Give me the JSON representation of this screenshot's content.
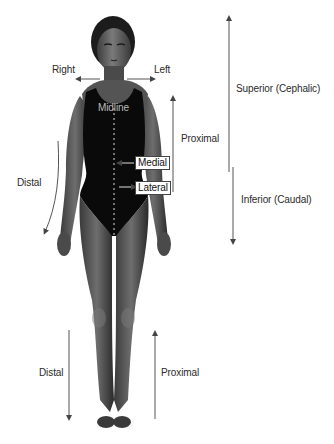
{
  "diagram": {
    "colors": {
      "background": "#ffffff",
      "skin": "#5e5e5e",
      "skin_highlight": "#8a8a8a",
      "swimsuit": "#0a0a0a",
      "arrow": "#555555",
      "text": "#2a2a2a"
    },
    "labels": {
      "right": "Right",
      "left": "Left",
      "midline": "Midline",
      "medial": "Medial",
      "lateral": "Lateral",
      "proximal_arm": "Proximal",
      "distal_arm": "Distal",
      "superior": "Superior (Cephalic)",
      "inferior": "Inferior (Caudal)",
      "distal_leg": "Distal",
      "proximal_leg": "Proximal"
    },
    "arrows": [
      {
        "id": "right",
        "direction": "left",
        "meaning": "Right"
      },
      {
        "id": "left",
        "direction": "right",
        "meaning": "Left"
      },
      {
        "id": "medial",
        "direction": "toward-midline",
        "meaning": "Medial"
      },
      {
        "id": "lateral",
        "direction": "away-from-midline",
        "meaning": "Lateral"
      },
      {
        "id": "proximal-arm",
        "direction": "up",
        "meaning": "Proximal"
      },
      {
        "id": "distal-arm",
        "direction": "down-curved",
        "meaning": "Distal"
      },
      {
        "id": "superior",
        "direction": "up",
        "meaning": "Superior (Cephalic)"
      },
      {
        "id": "inferior",
        "direction": "down",
        "meaning": "Inferior (Caudal)"
      },
      {
        "id": "distal-leg",
        "direction": "down",
        "meaning": "Distal"
      },
      {
        "id": "proximal-leg",
        "direction": "up",
        "meaning": "Proximal"
      }
    ]
  }
}
